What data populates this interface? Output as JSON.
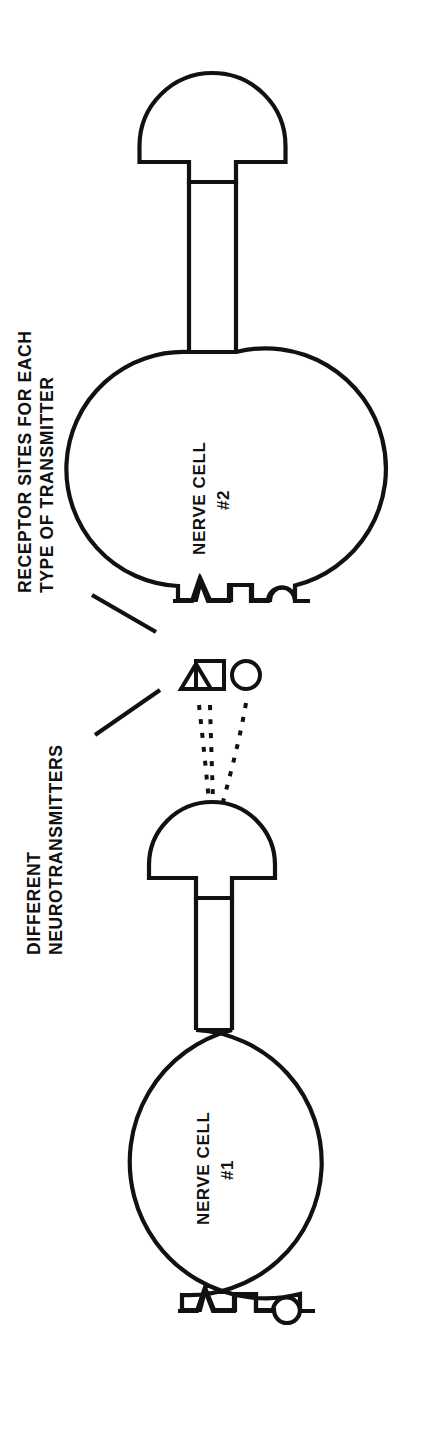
{
  "figure": {
    "orientation": "rotated-90-ccw",
    "background_color": "#ffffff",
    "stroke_color": "#111111"
  },
  "labels": {
    "receptor_line1": "RECEPTOR SITES FOR EACH",
    "receptor_line2": "TYPE OF TRANSMITTER",
    "transmitter_line1": "DIFFERENT",
    "transmitter_line2": "NEUROTRANSMITTERS",
    "cell2_line1": "NERVE CELL",
    "cell2_line2": "#2",
    "cell1_line1": "NERVE CELL",
    "cell1_line2": "#1"
  },
  "neurotransmitters": [
    {
      "name": "triangle-transmitter",
      "shape": "triangle"
    },
    {
      "name": "square-transmitter",
      "shape": "square"
    },
    {
      "name": "circle-transmitter",
      "shape": "circle"
    }
  ],
  "receptor_sites": [
    {
      "name": "triangle-receptor",
      "shape": "triangle-notch"
    },
    {
      "name": "square-receptor",
      "shape": "square-notch"
    },
    {
      "name": "circle-receptor",
      "shape": "circle-notch"
    }
  ],
  "cells": [
    {
      "name": "nerve-cell-1",
      "parts": [
        "soma",
        "axon",
        "axon-terminal",
        "dendrite-receptors"
      ]
    },
    {
      "name": "nerve-cell-2",
      "parts": [
        "soma",
        "axon",
        "axon-terminal",
        "dendrite-receptors"
      ]
    }
  ]
}
